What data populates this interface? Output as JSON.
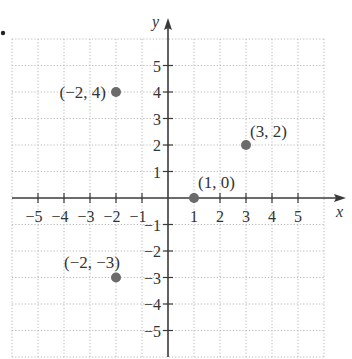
{
  "chart_data": {
    "type": "scatter",
    "title": "",
    "xlabel": "x",
    "ylabel": "y",
    "xlim": [
      -6,
      6
    ],
    "ylim": [
      -6,
      6
    ],
    "grid": true,
    "grid_style": "dotted",
    "legend": null,
    "x_ticks": [
      -5,
      -4,
      -3,
      -2,
      -1,
      1,
      2,
      3,
      4,
      5
    ],
    "y_ticks": [
      -5,
      -4,
      -3,
      -2,
      -1,
      1,
      2,
      3,
      4,
      5
    ],
    "x_tick_labels": [
      "−5",
      "−4",
      "−3",
      "−2",
      "−1",
      "1",
      "2",
      "3",
      "4",
      "5"
    ],
    "y_tick_labels": [
      "−5",
      "−4",
      "−3",
      "−2",
      "−1",
      "1",
      "2",
      "3",
      "4",
      "5"
    ],
    "points": [
      {
        "x": -2,
        "y": 4,
        "label": "(−2, 4)",
        "label_pos": "left"
      },
      {
        "x": 3,
        "y": 2,
        "label": "(3, 2)",
        "label_pos": "upper-right"
      },
      {
        "x": 1,
        "y": 0,
        "label": "(1, 0)",
        "label_pos": "above-right"
      },
      {
        "x": -2,
        "y": -3,
        "label": "(−2, −3)",
        "label_pos": "upper-left"
      }
    ],
    "colors": {
      "point": "#6b6b6b",
      "axis": "#3a3a3a",
      "grid": "#b8b8b8",
      "text": "#333333"
    }
  }
}
